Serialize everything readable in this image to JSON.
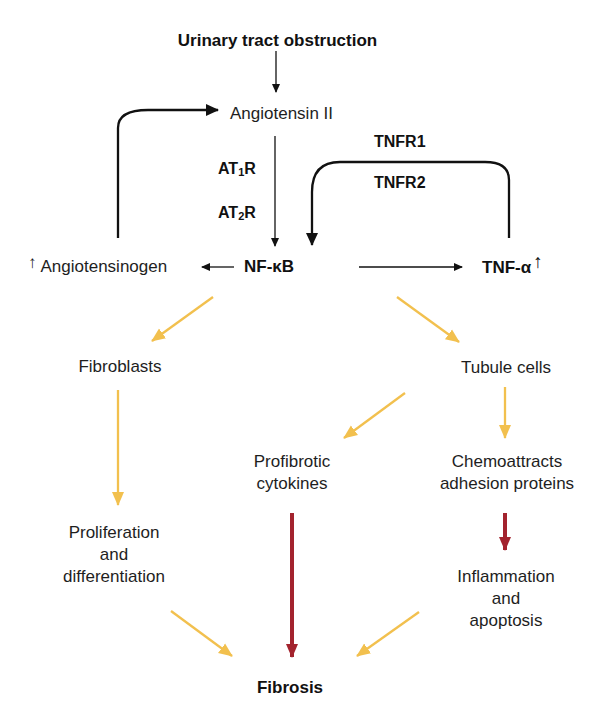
{
  "diagram": {
    "colors": {
      "black_arrow": "#111111",
      "yellow_arrow": "#f2c04e",
      "red_arrow": "#a3232e",
      "text": "#1e1e1e"
    },
    "nodes": {
      "urinary_obstruction": "Urinary tract obstruction",
      "angiotensin_ii": "Angiotensin II",
      "angiotensinogen": "Angiotensinogen",
      "angiotensinogen_up": "↑",
      "nfkb": "NF-κB",
      "tnfa": "TNF-α",
      "tnfa_up": "↑",
      "fibroblasts": "Fibroblasts",
      "tubule_cells": "Tubule cells",
      "profibrotic": [
        "Profibrotic",
        "cytokines"
      ],
      "chemoattracts": [
        "Chemoattracts",
        "adhesion proteins"
      ],
      "proliferation": [
        "Proliferation",
        "and",
        "differentiation"
      ],
      "inflammation": [
        "Inflammation",
        "and",
        "apoptosis"
      ],
      "fibrosis": "Fibrosis"
    },
    "labels": {
      "at1r_prefix": "AT",
      "at1r_sub": "1",
      "at1r_suffix": "R",
      "at2r_prefix": "AT",
      "at2r_sub": "2",
      "at2r_suffix": "R",
      "tnfr1": "TNFR1",
      "tnfr2": "TNFR2"
    },
    "edges": [
      {
        "from": "Urinary tract obstruction",
        "to": "Angiotensin II",
        "color": "black"
      },
      {
        "from": "Angiotensin II",
        "to": "NF-κB",
        "via": [
          "AT1R",
          "AT2R"
        ],
        "color": "black"
      },
      {
        "from": "NF-κB",
        "to": "Angiotensinogen",
        "color": "black"
      },
      {
        "from": "Angiotensinogen",
        "to": "Angiotensin II",
        "color": "black",
        "style": "feedback"
      },
      {
        "from": "NF-κB",
        "to": "TNF-α",
        "color": "black"
      },
      {
        "from": "TNF-α",
        "to": "NF-κB",
        "via": [
          "TNFR1",
          "TNFR2"
        ],
        "color": "black",
        "style": "feedback"
      },
      {
        "from": "NF-κB",
        "to": "Fibroblasts",
        "color": "yellow"
      },
      {
        "from": "NF-κB",
        "to": "Tubule cells",
        "color": "yellow"
      },
      {
        "from": "Fibroblasts",
        "to": "Proliferation and differentiation",
        "color": "yellow"
      },
      {
        "from": "Tubule cells",
        "to": "Profibrotic cytokines",
        "color": "yellow"
      },
      {
        "from": "Tubule cells",
        "to": "Chemoattracts adhesion proteins",
        "color": "yellow"
      },
      {
        "from": "Profibrotic cytokines",
        "to": "Fibrosis",
        "color": "red"
      },
      {
        "from": "Chemoattracts adhesion proteins",
        "to": "Inflammation and apoptosis",
        "color": "red"
      },
      {
        "from": "Proliferation and differentiation",
        "to": "Fibrosis",
        "color": "yellow"
      },
      {
        "from": "Inflammation and apoptosis",
        "to": "Fibrosis",
        "color": "yellow"
      }
    ]
  }
}
